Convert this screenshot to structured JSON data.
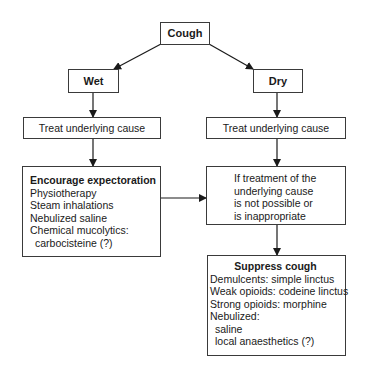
{
  "diagram": {
    "type": "flowchart",
    "nodes": {
      "cough": {
        "label": "Cough"
      },
      "wet": {
        "label": "Wet"
      },
      "dry": {
        "label": "Dry"
      },
      "treat_wet": {
        "label": "Treat underlying cause"
      },
      "treat_dry": {
        "label": "Treat underlying cause"
      },
      "expectoration": {
        "title": "Encourage expectoration",
        "lines": [
          "Physiotherapy",
          "Steam inhalations",
          "Nebulized saline",
          "Chemical mucolytics:",
          "carbocisteine (?)"
        ]
      },
      "condition": {
        "lines": [
          "If treatment of the",
          "underlying cause",
          "is not possible or",
          "is inappropriate"
        ]
      },
      "suppress": {
        "title": "Suppress cough",
        "lines": [
          "Demulcents: simple linctus",
          "Weak opioids: codeine linctus",
          "Strong opioids: morphine",
          "Nebulized:",
          "saline",
          "local anaesthetics (?)"
        ]
      }
    },
    "edges": [
      {
        "from": "cough",
        "to": "wet"
      },
      {
        "from": "cough",
        "to": "dry"
      },
      {
        "from": "wet",
        "to": "treat_wet"
      },
      {
        "from": "dry",
        "to": "treat_dry"
      },
      {
        "from": "treat_wet",
        "to": "expectoration"
      },
      {
        "from": "treat_dry",
        "to": "condition"
      },
      {
        "from": "expectoration",
        "to": "condition"
      },
      {
        "from": "condition",
        "to": "suppress"
      }
    ]
  }
}
